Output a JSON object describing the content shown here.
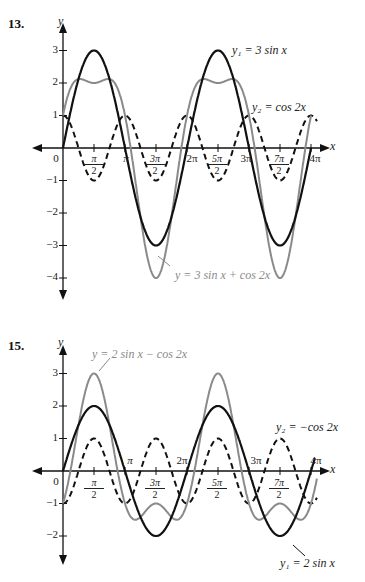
{
  "problems": [
    {
      "number": "13.",
      "axis_y_label": "y",
      "axis_x_label": "x",
      "label_y1": "y₁ = 3 sin x",
      "label_y2": "y₂ = cos 2x",
      "label_sum": "y = 3 sin x + cos 2x",
      "y_ticks": [
        "3",
        "2",
        "1",
        "−1",
        "−2",
        "−3",
        "−4"
      ],
      "x_ticks": {
        "origin": "0",
        "pi": "π",
        "two_pi": "2π",
        "three_pi": "3π",
        "four_pi": "4π",
        "pi_num": "π",
        "three_pi_num": "3π",
        "five_pi_num": "5π",
        "seven_pi_num": "7π",
        "den": "2"
      }
    },
    {
      "number": "15.",
      "axis_y_label": "y",
      "axis_x_label": "x",
      "label_y1": "y₁ = 2 sin x",
      "label_y2": "y₂ = −cos 2x",
      "label_sum": "y = 2 sin x − cos 2x",
      "y_ticks": [
        "3",
        "2",
        "1",
        "−1",
        "−2"
      ],
      "x_ticks": {
        "origin": "0",
        "pi": "π",
        "two_pi": "2π",
        "three_pi": "3π",
        "four_pi": "4π",
        "pi_num": "π",
        "three_pi_num": "3π",
        "five_pi_num": "5π",
        "seven_pi_num": "7π",
        "den": "2"
      }
    }
  ],
  "chart_data": [
    {
      "type": "line",
      "title": "13.",
      "xlabel": "x",
      "ylabel": "y",
      "xlim": [
        0,
        12.566
      ],
      "ylim": [
        -4.5,
        3.5
      ],
      "x_tick_labels": [
        "0",
        "π/2",
        "π",
        "3π/2",
        "2π",
        "5π/2",
        "3π",
        "7π/2",
        "4π"
      ],
      "y_tick_labels": [
        -4,
        -3,
        -2,
        -1,
        1,
        2,
        3
      ],
      "series": [
        {
          "name": "y1 = 3 sin x",
          "style": "solid black",
          "expr": "3*sin(x)",
          "max": 3,
          "min": -3
        },
        {
          "name": "y2 = cos 2x",
          "style": "dashed black",
          "expr": "cos(2x)",
          "max": 1,
          "min": -1
        },
        {
          "name": "y = 3 sin x + cos 2x",
          "style": "solid gray",
          "expr": "3*sin(x)+cos(2x)",
          "max": 2.125,
          "min": -4
        }
      ]
    },
    {
      "type": "line",
      "title": "15.",
      "xlabel": "x",
      "ylabel": "y",
      "xlim": [
        0,
        12.566
      ],
      "ylim": [
        -2.5,
        3.5
      ],
      "x_tick_labels": [
        "0",
        "π/2",
        "π",
        "3π/2",
        "2π",
        "5π/2",
        "3π",
        "7π/2",
        "4π"
      ],
      "y_tick_labels": [
        -2,
        -1,
        1,
        2,
        3
      ],
      "series": [
        {
          "name": "y1 = 2 sin x",
          "style": "solid black",
          "expr": "2*sin(x)",
          "max": 2,
          "min": -2
        },
        {
          "name": "y2 = -cos 2x",
          "style": "dashed black",
          "expr": "-cos(2x)",
          "max": 1,
          "min": -1
        },
        {
          "name": "y = 2 sin x - cos 2x",
          "style": "solid gray",
          "expr": "2*sin(x)-cos(2x)",
          "max": 3,
          "min": -1.5
        }
      ]
    }
  ]
}
